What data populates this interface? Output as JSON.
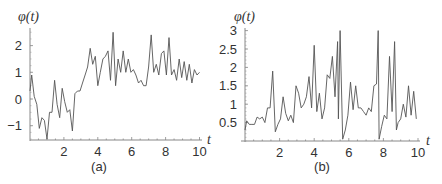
{
  "chart_data": [
    {
      "type": "line",
      "panel_label": "(a)",
      "title": "",
      "xlabel": "t",
      "ylabel": "φ(t)",
      "xlim": [
        0,
        10
      ],
      "ylim": [
        -1.5,
        2.5
      ],
      "grid": false,
      "legend": null,
      "xticks": [
        "2",
        "4",
        "6",
        "8",
        "10"
      ],
      "yticks": [
        "-1",
        "0",
        "1",
        "2"
      ],
      "x": [
        0,
        0.1,
        0.25,
        0.4,
        0.55,
        0.7,
        0.85,
        1.0,
        1.15,
        1.3,
        1.45,
        1.6,
        1.75,
        1.9,
        2.05,
        2.2,
        2.35,
        2.5,
        2.65,
        2.8,
        2.95,
        3.1,
        3.25,
        3.4,
        3.55,
        3.7,
        3.85,
        4.0,
        4.15,
        4.3,
        4.45,
        4.6,
        4.75,
        4.9,
        5.05,
        5.2,
        5.35,
        5.5,
        5.65,
        5.8,
        5.95,
        6.1,
        6.25,
        6.4,
        6.55,
        6.7,
        6.85,
        7.0,
        7.15,
        7.3,
        7.45,
        7.6,
        7.75,
        7.9,
        8.05,
        8.2,
        8.35,
        8.5,
        8.65,
        8.8,
        8.95,
        9.1,
        9.25,
        9.4,
        9.55,
        9.7,
        9.85,
        10.0
      ],
      "values": [
        0.3,
        0.9,
        0.1,
        -0.2,
        -1.1,
        -0.7,
        -0.8,
        -1.5,
        -0.5,
        -0.5,
        0.7,
        -0.2,
        -0.7,
        0.4,
        -0.1,
        -0.5,
        -0.4,
        -1.2,
        0.2,
        0.3,
        0.3,
        0.6,
        0.9,
        1.2,
        1.9,
        1.3,
        1.6,
        0.5,
        1.0,
        1.5,
        1.6,
        1.8,
        0.7,
        2.5,
        0.5,
        1.5,
        1.0,
        1.8,
        1.0,
        1.5,
        1.0,
        1.1,
        0.9,
        0.6,
        0.7,
        0.5,
        0.5,
        1.2,
        2.4,
        1.0,
        1.3,
        0.9,
        1.7,
        1.8,
        0.9,
        2.3,
        0.9,
        1.1,
        0.7,
        1.5,
        0.8,
        1.4,
        0.7,
        1.3,
        0.6,
        1.1,
        0.9,
        1.0
      ]
    },
    {
      "type": "line",
      "panel_label": "(b)",
      "title": "",
      "xlabel": "t",
      "ylabel": "φ(t)",
      "xlim": [
        0,
        10
      ],
      "ylim": [
        0,
        3
      ],
      "grid": false,
      "legend": null,
      "xticks": [
        "2",
        "4",
        "6",
        "8",
        "10"
      ],
      "yticks": [
        "0.5",
        "1",
        "1.5",
        "2",
        "2.5",
        "3"
      ],
      "x": [
        0,
        0.1,
        0.25,
        0.4,
        0.55,
        0.7,
        0.85,
        1.0,
        1.15,
        1.3,
        1.45,
        1.6,
        1.75,
        1.9,
        2.05,
        2.2,
        2.35,
        2.5,
        2.65,
        2.8,
        2.95,
        3.1,
        3.25,
        3.4,
        3.55,
        3.7,
        3.85,
        4.0,
        4.15,
        4.3,
        4.45,
        4.6,
        4.75,
        4.9,
        5.05,
        5.2,
        5.35,
        5.4,
        5.5,
        5.65,
        5.8,
        5.95,
        6.1,
        6.25,
        6.4,
        6.55,
        6.7,
        6.85,
        7.0,
        7.15,
        7.3,
        7.45,
        7.6,
        7.7,
        7.75,
        7.9,
        8.05,
        8.2,
        8.35,
        8.5,
        8.65,
        8.75,
        8.85,
        9.0,
        9.15,
        9.3,
        9.45,
        9.6,
        9.75,
        9.9
      ],
      "values": [
        0.3,
        0.55,
        0.45,
        0.45,
        0.45,
        0.65,
        0.6,
        0.65,
        0.5,
        0.9,
        0.9,
        1.9,
        0.25,
        0.45,
        0.6,
        1.2,
        0.75,
        0.55,
        0.7,
        0.5,
        1.5,
        1.3,
        0.9,
        1.0,
        1.2,
        1.75,
        0.9,
        2.6,
        0.8,
        1.3,
        0.6,
        0.9,
        1.8,
        1.7,
        2.3,
        1.2,
        2.7,
        0.6,
        3.0,
        0.05,
        0.3,
        0.7,
        1.6,
        0.85,
        1.5,
        0.9,
        0.9,
        0.8,
        0.7,
        0.9,
        0.8,
        1.5,
        1.55,
        3.0,
        0.05,
        0.4,
        0.7,
        0.6,
        2.3,
        0.8,
        2.7,
        0.3,
        0.5,
        0.6,
        1.0,
        0.65,
        1.5,
        0.7,
        1.35,
        0.6
      ]
    }
  ]
}
